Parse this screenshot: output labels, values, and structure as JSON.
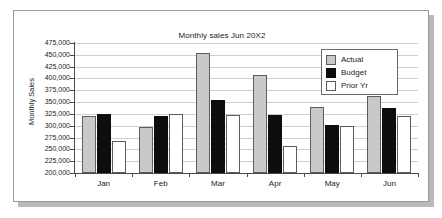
{
  "chart_data": {
    "type": "bar",
    "title": "Monthly sales Jun 20X2",
    "xlabel": "",
    "ylabel": "Monthly Sales",
    "categories": [
      "Jan",
      "Feb",
      "Mar",
      "Apr",
      "May",
      "Jun"
    ],
    "series": [
      {
        "name": "Actual",
        "values": [
          320000,
          298000,
          453000,
          407000,
          340000,
          362000
        ]
      },
      {
        "name": "Budget",
        "values": [
          325000,
          320000,
          355000,
          322000,
          302000,
          337000
        ]
      },
      {
        "name": "Prior Yr",
        "values": [
          268000,
          325000,
          323000,
          258000,
          300000,
          320000
        ]
      }
    ],
    "ylim": [
      200000,
      475000
    ],
    "ytick_step": 25000,
    "ytick_labels": [
      "475,000",
      "450,000",
      "425,000",
      "400,000",
      "375,000",
      "350,000",
      "325,000",
      "300,000",
      "275,000",
      "250,000",
      "225,000",
      "200,000"
    ],
    "grid": true,
    "legend_position": "top-right",
    "colors": {
      "actual": "#c9c9c9",
      "budget": "#0d0d0d",
      "prior": "#ffffff",
      "bar_outline": "#5d5d5d",
      "axis": "#4a4a4a",
      "gridline": "#cfcfcf",
      "panel_border": "#9a9a9a",
      "panel_shadow": "#b9b9b9",
      "text": "#1b1b1b"
    }
  },
  "legend": {
    "items": [
      {
        "label": "Actual",
        "key": "actual"
      },
      {
        "label": "Budget",
        "key": "budget"
      },
      {
        "label": "Prior Yr",
        "key": "prior"
      }
    ]
  }
}
